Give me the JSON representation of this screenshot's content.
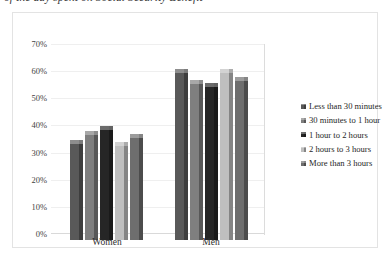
{
  "chart_title_clipped": "of the day spent on Social Security Benefit",
  "axis": {
    "y_ticks": [
      "70%",
      "60%",
      "50%",
      "40%",
      "30%",
      "20%",
      "10%",
      "0%"
    ],
    "y_tick_values": [
      70,
      60,
      50,
      40,
      30,
      20,
      10,
      0
    ],
    "x_categories": [
      "Women",
      "Men"
    ]
  },
  "legend": {
    "items": [
      {
        "label": "Less than 30 minutes",
        "color": "#595959"
      },
      {
        "label": "30 minutes to 1 hour",
        "color": "#7f7f7f"
      },
      {
        "label": "1 hour to 2 hours",
        "color": "#262626"
      },
      {
        "label": "2 hours to 3 hours",
        "color": "#bfbfbf"
      },
      {
        "label": "More than 3 hours",
        "color": "#6e6e6e"
      }
    ]
  },
  "chart_data": {
    "type": "bar",
    "title": "of the day spent on Social Security Benefit",
    "xlabel": "",
    "ylabel": "",
    "ylim": [
      0,
      70
    ],
    "grid": true,
    "legend_position": "right",
    "categories": [
      "Women",
      "Men"
    ],
    "series": [
      {
        "name": "Less than 30 minutes",
        "color": "#595959",
        "values": [
          37,
          63
        ]
      },
      {
        "name": "30 minutes to 1 hour",
        "color": "#7f7f7f",
        "values": [
          40,
          59
        ]
      },
      {
        "name": "1 hour to 2 hours",
        "color": "#262626",
        "values": [
          42,
          58
        ]
      },
      {
        "name": "2 hours to 3 hours",
        "color": "#bfbfbf",
        "values": [
          36,
          63
        ]
      },
      {
        "name": "More than 3 hours",
        "color": "#6e6e6e",
        "values": [
          39,
          60
        ]
      }
    ],
    "value_unit": "%"
  }
}
